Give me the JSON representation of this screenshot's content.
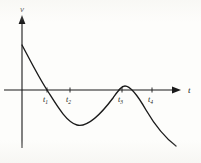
{
  "figure": {
    "background_color": "#fdfdfb",
    "ink_color": "#1a1a1a",
    "axes": {
      "vertical_label": "v",
      "horizontal_label": "t",
      "origin": {
        "x": 22,
        "y": 90
      },
      "vertical_span": {
        "top": 18,
        "bottom": 148
      },
      "horizontal_span": {
        "left": 4,
        "right": 178
      }
    },
    "tick_labels": [
      {
        "name": "t1",
        "base": "t",
        "sub": "1",
        "x": 47,
        "y": 101
      },
      {
        "name": "t2",
        "base": "t",
        "sub": "2",
        "x": 70,
        "y": 101
      },
      {
        "name": "t3",
        "base": "t",
        "sub": "3",
        "x": 122,
        "y": 101
      },
      {
        "name": "t4",
        "base": "t",
        "sub": "4",
        "x": 152,
        "y": 101
      }
    ]
  },
  "chart_data": {
    "type": "line",
    "title": "",
    "xlabel": "t",
    "ylabel": "v",
    "grid": false,
    "legend": false,
    "axis_style": "arrowed-cartesian",
    "xlim": [
      0,
      180
    ],
    "ylim": [
      -60,
      50
    ],
    "zero_crossings": [
      "t1",
      "t3"
    ],
    "tick_marks": [
      "t1",
      "t2",
      "t3",
      "t4"
    ],
    "annotations": [
      "curve begins at positive v on the vertical axis",
      "descends through zero at t1",
      "minimum between t1 and t3",
      "rises to a maximum just above zero near t3",
      "descends again past t4 off the lower right"
    ],
    "x": [
      22,
      30,
      38,
      47,
      56,
      64,
      70,
      78,
      86,
      95,
      104,
      113,
      122,
      131,
      140,
      152,
      163,
      175
    ],
    "y": [
      45,
      36,
      22,
      0,
      -16,
      -28,
      -33,
      -35,
      -32,
      -24,
      -14,
      -5,
      2,
      1,
      -6,
      -22,
      -39,
      -56
    ],
    "points_px": [
      {
        "label": "start",
        "x": 22,
        "y": 45
      },
      {
        "label": "t1-crossing",
        "x": 47,
        "y": 90
      },
      {
        "label": "minimum",
        "x": 77,
        "y": 125
      },
      {
        "label": "t3-peak",
        "x": 124,
        "y": 86
      },
      {
        "label": "end",
        "x": 176,
        "y": 146
      }
    ]
  }
}
